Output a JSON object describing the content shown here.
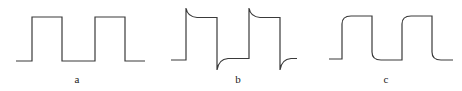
{
  "figure": {
    "panels": [
      {
        "id": "a",
        "label": "a",
        "shape": "ideal square wave",
        "cycles": 2
      },
      {
        "id": "b",
        "label": "b",
        "shape": "square wave with overshoot spikes and exponential decay (differentiated edges)",
        "cycles": 2
      },
      {
        "id": "c",
        "label": "c",
        "shape": "square wave with rounded (integrated) edges",
        "cycles": 2
      }
    ],
    "stroke_color": "#3a3a3a"
  }
}
